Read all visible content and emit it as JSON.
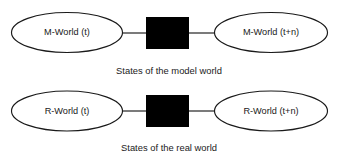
{
  "diagram": {
    "type": "state-transition-diagram",
    "background_color": "#ffffff",
    "stroke_color": "#1a1a1a",
    "box_fill_color": "#000000",
    "node_fill_color": "#ffffff",
    "rows": [
      {
        "id": "model-world",
        "caption": "States of the model world",
        "start_state": "M-World (t)",
        "end_state": "M-World (t+n)",
        "transition": "black-box"
      },
      {
        "id": "real-world",
        "caption": "States of the real world",
        "start_state": "R-World (t)",
        "end_state": "R-World (t+n)",
        "transition": "black-box"
      }
    ]
  }
}
